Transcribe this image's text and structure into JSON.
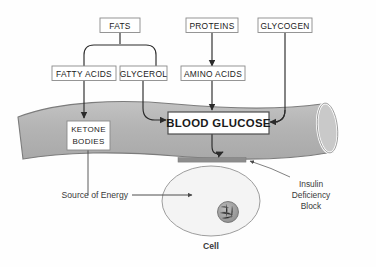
{
  "diagram": {
    "colors": {
      "background": "#fefefe",
      "vessel_fill": "#b6b6b6",
      "vessel_stroke": "#6f6f6f",
      "vessel_lumen_rim": "#ffffff",
      "cell_fill": "#f2f2f2",
      "cell_stroke": "#9a9a9a",
      "nucleus_fill": "#9e9e9e",
      "nucleus_stroke": "#6d6d6d",
      "block_bar": "#8c8c8c",
      "box_fill": "#ffffff",
      "box_stroke": "#808080",
      "text": "#1a1a1a",
      "arrow": "#2b2b2b"
    },
    "boxes": [
      {
        "id": "fats",
        "label": "FATS"
      },
      {
        "id": "proteins",
        "label": "PROTEINS"
      },
      {
        "id": "glycogen",
        "label": "GLYCOGEN"
      },
      {
        "id": "fatty_acids",
        "label": "FATTY ACIDS"
      },
      {
        "id": "glycerol",
        "label": "GLYCEROL"
      },
      {
        "id": "amino_acids",
        "label": "AMINO ACIDS"
      },
      {
        "id": "ketone_bodies",
        "label_line1": "KETONE",
        "label_line2": "BODIES"
      },
      {
        "id": "blood_glucose",
        "label": "BLOOD GLUCOSE"
      }
    ],
    "annotations": {
      "source_of_energy": "Source of Energy",
      "insulin_block_line1": "Insulin",
      "insulin_block_line2": "Deficiency",
      "insulin_block_line3": "Block",
      "cell": "Cell"
    }
  }
}
